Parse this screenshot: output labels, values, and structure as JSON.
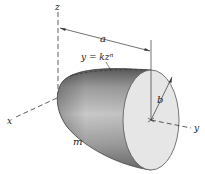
{
  "figure": {
    "labels": {
      "z_axis": "z",
      "x_axis": "x",
      "y_axis": "y",
      "length": "a",
      "radius": "b",
      "mass": "m",
      "curve_equation_lhs": "y = kz",
      "curve_equation_exp": "n"
    },
    "colors": {
      "body_dark": "#6e6e6e",
      "body_mid": "#a9a9a9",
      "body_light": "#d2d2d2",
      "face": "#e4e4e4",
      "lines": "#333333"
    }
  }
}
